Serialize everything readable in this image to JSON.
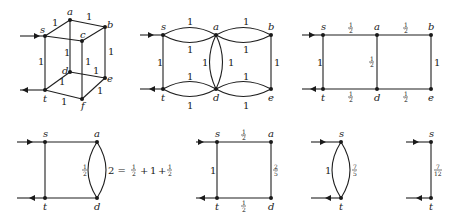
{
  "diagram": {
    "panels": [
      {
        "id": "cube",
        "nodes": [
          "s",
          "a",
          "b",
          "c",
          "d",
          "e",
          "t",
          "f"
        ],
        "edge_weights": {
          "s-a": "1",
          "a-b": "1",
          "s-c": "1",
          "b-c": "",
          "a-d": "1",
          "b-e": "1",
          "s-t": "1",
          "c-f": "1",
          "d-e": "1",
          "t-d": "1",
          "e-f": "1",
          "t-f": "1"
        },
        "terminals": {
          "in": "s",
          "out": "t"
        }
      },
      {
        "id": "unfolded",
        "nodes": [
          "s",
          "a",
          "b",
          "t",
          "d",
          "e"
        ],
        "edge_weights": {
          "s-a-top": "1",
          "s-a-bottom": "1",
          "a-b-top": "1",
          "a-b-bottom": "1",
          "s-t": "1",
          "a-d-left": "1",
          "a-d-right": "1",
          "b-e": "1",
          "t-d-top": "1",
          "t-d-bottom": "1",
          "d-e-top": "1",
          "d-e-bottom": "1"
        }
      },
      {
        "id": "series-parallel-1",
        "nodes": [
          "s",
          "a",
          "b",
          "t",
          "d",
          "e"
        ],
        "edge_weights": {
          "s-a": "1/2",
          "a-b": "1/2",
          "s-t": "1",
          "a-d": "1/2",
          "b-e": "1",
          "t-d": "1/2",
          "d-e": "1/2"
        }
      },
      {
        "id": "series-parallel-2",
        "nodes": [
          "s",
          "a",
          "t",
          "d"
        ],
        "edge_weights": {
          "a-d-left": "1/2",
          "a-d-right": "2"
        },
        "equation": "2 = 1/2 + 1 + 1/2"
      },
      {
        "id": "series-parallel-3",
        "nodes": [
          "s",
          "a",
          "t",
          "d"
        ],
        "edge_weights": {
          "s-a": "1/2",
          "s-t": "1",
          "a-d": "2/5",
          "t-d": "1/2"
        }
      },
      {
        "id": "series-parallel-4",
        "nodes": [
          "s",
          "t"
        ],
        "edge_weights": {
          "s-t-left": "1",
          "s-t-right": "7/5"
        }
      },
      {
        "id": "final",
        "nodes": [
          "s",
          "t"
        ],
        "edge_weights": {
          "s-t": "7/12"
        }
      }
    ]
  },
  "labels": {
    "s": "s",
    "a": "a",
    "b": "b",
    "c": "c",
    "d": "d",
    "e": "e",
    "t": "t",
    "f": "f",
    "one": "1",
    "two": "2",
    "eq": "2 = ",
    "plus": "+",
    "half_num": "1",
    "half_den": "2",
    "two_fifths_num": "2",
    "two_fifths_den": "5",
    "seven_fifths_num": "7",
    "seven_fifths_den": "5",
    "seven_twelfths_num": "7",
    "seven_twelfths_den": "12"
  }
}
